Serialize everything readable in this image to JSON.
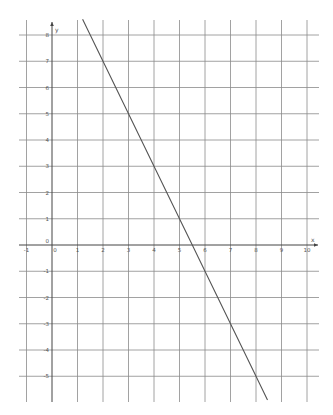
{
  "chart_data": {
    "type": "line",
    "title": "",
    "xlabel": "x",
    "ylabel": "y",
    "xlim": [
      -1.3,
      10.4
    ],
    "ylim": [
      -6.2,
      8.6
    ],
    "grid": true,
    "legend": null,
    "x_ticks": [
      -1,
      0,
      1,
      2,
      3,
      4,
      5,
      6,
      7,
      8,
      9,
      10
    ],
    "y_ticks": [
      -5,
      -4,
      -3,
      -2,
      -1,
      1,
      2,
      3,
      4,
      5,
      6,
      7,
      8
    ],
    "x_tick_labels": [
      "-1",
      "0",
      "1",
      "2",
      "3",
      "4",
      "5",
      "6",
      "7",
      "8",
      "9",
      "10"
    ],
    "y_tick_labels": [
      "-5",
      "-4",
      "-3",
      "-2",
      "-1",
      "1",
      "2",
      "3",
      "4",
      "5",
      "6",
      "7",
      "8"
    ],
    "origin_label": "0",
    "series": [
      {
        "name": "y = -2x + 11",
        "color": "#555555",
        "x": [
          1.2,
          2,
          3,
          4,
          5,
          5.5,
          6,
          7,
          8,
          8.45
        ],
        "y": [
          8.6,
          7,
          5,
          3,
          1,
          0,
          -1,
          -3,
          -5,
          -5.9
        ]
      }
    ]
  },
  "colors": {
    "grid": "#8a8a8a",
    "axis": "#444444",
    "line": "#555555",
    "label": "#555555"
  }
}
